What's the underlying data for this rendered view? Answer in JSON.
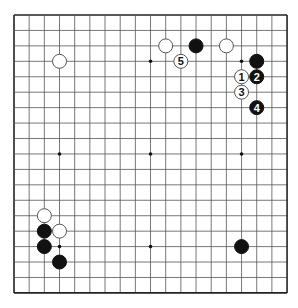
{
  "diagram": {
    "type": "go-board",
    "size": 19,
    "origin": {
      "x": 14,
      "y": 15
    },
    "spacing": {
      "x": 15.17,
      "y": 15.44
    },
    "stone_radius": 7,
    "colors": {
      "background": "#ffffff",
      "grid": "#555555",
      "border": "#222222",
      "black_stone": "#111111",
      "white_stone_fill": "#ffffff",
      "white_stone_stroke": "#555555",
      "hoshi": "#111111"
    },
    "hoshi": [
      {
        "col": 3,
        "row": 3
      },
      {
        "col": 9,
        "row": 3
      },
      {
        "col": 15,
        "row": 3
      },
      {
        "col": 3,
        "row": 9
      },
      {
        "col": 9,
        "row": 9
      },
      {
        "col": 15,
        "row": 9
      },
      {
        "col": 3,
        "row": 15
      },
      {
        "col": 9,
        "row": 15
      },
      {
        "col": 15,
        "row": 15
      }
    ],
    "stones": [
      {
        "color": "white",
        "col": 3,
        "row": 3,
        "label": ""
      },
      {
        "color": "white",
        "col": 10,
        "row": 2,
        "label": ""
      },
      {
        "color": "black",
        "col": 12,
        "row": 2,
        "label": ""
      },
      {
        "color": "white",
        "col": 14,
        "row": 2,
        "label": ""
      },
      {
        "color": "black",
        "col": 16,
        "row": 3,
        "label": ""
      },
      {
        "color": "white",
        "col": 15,
        "row": 4,
        "label": "1"
      },
      {
        "color": "black",
        "col": 16,
        "row": 4,
        "label": "2"
      },
      {
        "color": "white",
        "col": 15,
        "row": 5,
        "label": "3"
      },
      {
        "color": "black",
        "col": 16,
        "row": 6,
        "label": "4"
      },
      {
        "color": "white",
        "col": 11,
        "row": 3,
        "label": "5"
      },
      {
        "color": "white",
        "col": 2,
        "row": 13,
        "label": ""
      },
      {
        "color": "black",
        "col": 2,
        "row": 14,
        "label": ""
      },
      {
        "color": "white",
        "col": 3,
        "row": 14,
        "label": ""
      },
      {
        "color": "black",
        "col": 2,
        "row": 15,
        "label": ""
      },
      {
        "color": "black",
        "col": 3,
        "row": 16,
        "label": ""
      },
      {
        "color": "black",
        "col": 15,
        "row": 15,
        "label": ""
      }
    ]
  }
}
